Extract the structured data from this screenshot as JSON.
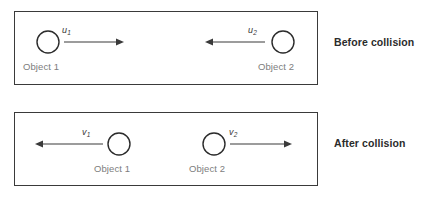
{
  "diagram": {
    "panels": [
      {
        "id": "before",
        "caption": "Before collision",
        "objects": [
          {
            "label": "Object 1",
            "velocity_symbol": "u",
            "velocity_subscript": "1",
            "direction": "right"
          },
          {
            "label": "Object 2",
            "velocity_symbol": "u",
            "velocity_subscript": "2",
            "direction": "left"
          }
        ]
      },
      {
        "id": "after",
        "caption": "After collision",
        "objects": [
          {
            "label": "Object 1",
            "velocity_symbol": "v",
            "velocity_subscript": "1",
            "direction": "left"
          },
          {
            "label": "Object 2",
            "velocity_symbol": "v",
            "velocity_subscript": "2",
            "direction": "right"
          }
        ]
      }
    ]
  },
  "colors": {
    "panel_border": "#3a3a3a",
    "circle_stroke": "#2b2b2b",
    "arrow": "#3a3a3a",
    "object_label": "#7d7d7d",
    "caption": "#2b2b2b",
    "background": "#ffffff"
  }
}
